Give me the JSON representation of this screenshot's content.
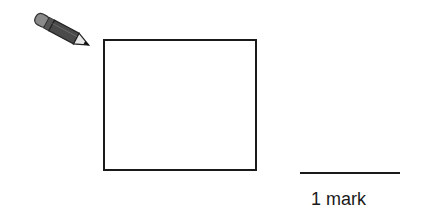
{
  "icons": {
    "pencil": "pencil-icon"
  },
  "answer_box": {
    "value": ""
  },
  "marks": {
    "label": "1 mark"
  }
}
